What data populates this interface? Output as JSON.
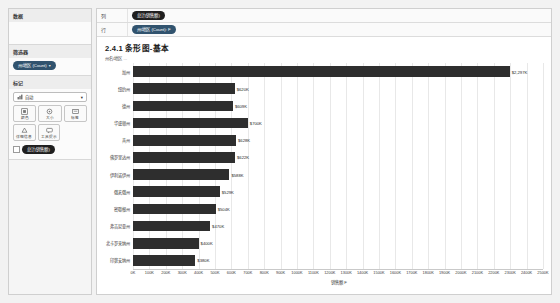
{
  "app": {
    "left_panel": {
      "sections": [
        {
          "title": "数据",
          "type": "blank"
        },
        {
          "title": "筛选器",
          "type": "pills",
          "pills": [
            {
              "label": "州/地区 (Count)",
              "icon": "caret-down-icon"
            }
          ]
        },
        {
          "title": "标记",
          "type": "marks"
        }
      ],
      "marks": {
        "mark_type": "自动",
        "mark_type_icon": "bar-mark-icon",
        "buttons": [
          {
            "label": "颜色",
            "icon": "color-icon"
          },
          {
            "label": "大小",
            "icon": "size-icon"
          },
          {
            "label": "标签",
            "icon": "label-icon"
          },
          {
            "label": "详细信息",
            "icon": "detail-icon"
          },
          {
            "label": "工具提示",
            "icon": "tooltip-icon"
          }
        ],
        "pill": {
          "label": "总计(销售额)",
          "icon": "measure-icon"
        }
      }
    },
    "shelves": [
      {
        "name": "列",
        "pills": [
          {
            "label": "总计(销售额)"
          }
        ]
      },
      {
        "name": "行",
        "pills": [
          {
            "label": "州/地区 (Count): F"
          }
        ]
      }
    ],
    "worksheet": {
      "title": "2.4.1 条形图-基本",
      "subtitle": "州名/地区 ..."
    }
  },
  "chart_data": {
    "type": "bar",
    "orientation": "horizontal",
    "title": "2.4.1 条形图-基本",
    "xlabel": "销售额 F",
    "ylabel": "",
    "xlim": [
      0,
      2500
    ],
    "xunit": "K",
    "grid": true,
    "bar_color": "#2e2e2e",
    "categories": [
      "加州",
      "纽约州",
      "德州",
      "华盛顿州",
      "宾州",
      "佛罗里达州",
      "伊利诺伊州",
      "俄亥俄州",
      "密歇根州",
      "弗吉尼亚州",
      "北卡罗来纳州",
      "印第安纳州"
    ],
    "values": [
      2297,
      620,
      609,
      700,
      628,
      622,
      588,
      529,
      504,
      470,
      400,
      380
    ],
    "value_labels": [
      "$2,297K",
      "$620K",
      "$609K",
      "$700K",
      "$628K",
      "$622K",
      "$588K",
      "$529K",
      "$504K",
      "$470K",
      "$400K",
      "$380K"
    ],
    "xticks": [
      0,
      100,
      200,
      300,
      400,
      500,
      600,
      700,
      800,
      900,
      1000,
      1100,
      1200,
      1300,
      1400,
      1500,
      1600,
      1700,
      1800,
      1900,
      2000,
      2100,
      2200,
      2300,
      2400,
      2500
    ],
    "xticklabels": [
      "0K",
      "100K",
      "200K",
      "300K",
      "400K",
      "500K",
      "600K",
      "700K",
      "800K",
      "900K",
      "1000K",
      "1100K",
      "1200K",
      "1300K",
      "1400K",
      "1500K",
      "1600K",
      "1700K",
      "1800K",
      "1900K",
      "2000K",
      "2100K",
      "2200K",
      "2300K",
      "2400K",
      "2500K"
    ]
  }
}
